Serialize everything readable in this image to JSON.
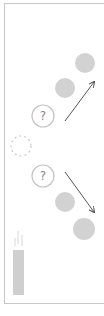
{
  "diagram": {
    "colors": {
      "frame": "#c8c8c8",
      "filled_circle": "#d2d2d2",
      "outline_circle": "#c4c4c4",
      "arrow": "#555555",
      "candle": "#cfcfcf",
      "wisp": "#d8d8d8",
      "text": "#888888"
    },
    "unknown_nodes": [
      {
        "label": "?",
        "cx": 43,
        "cy": 116,
        "r": 11
      },
      {
        "label": "?",
        "cx": 43,
        "cy": 176,
        "r": 11
      }
    ],
    "filled_circles": [
      {
        "cx": 85,
        "cy": 63,
        "r": 10
      },
      {
        "cx": 65,
        "cy": 88,
        "r": 10
      },
      {
        "cx": 65,
        "cy": 202,
        "r": 10
      },
      {
        "cx": 84,
        "cy": 229,
        "r": 11
      }
    ],
    "dotted_circle": {
      "cx": 21,
      "cy": 146,
      "r": 10
    },
    "arrows": [
      {
        "x1": 65,
        "y1": 121,
        "x2": 94,
        "y2": 82
      },
      {
        "x1": 65,
        "y1": 172,
        "x2": 94,
        "y2": 212
      }
    ],
    "candle": {
      "x": 13,
      "y": 250,
      "w": 11,
      "h": 45
    }
  }
}
